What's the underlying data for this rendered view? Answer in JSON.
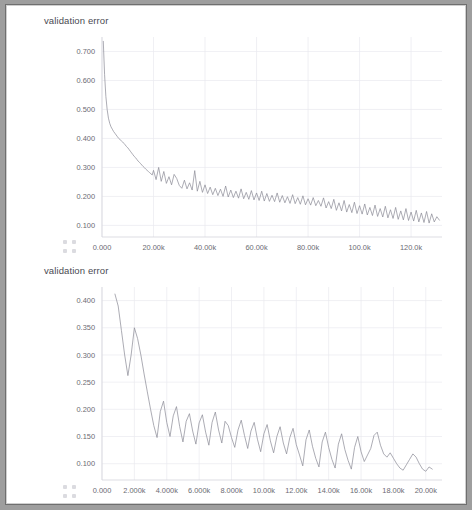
{
  "page": {
    "background_color": "#ffffff",
    "border_color": "#6f6f6f",
    "outer_color": "#9e9e9e"
  },
  "charts": [
    {
      "id": "chart-top",
      "title": "validation error",
      "grip_icon": "resize-grip-icon"
    },
    {
      "id": "chart-bottom",
      "title": "validation error",
      "grip_icon": "resize-grip-icon"
    }
  ],
  "chart_data": [
    {
      "type": "line",
      "title": "validation error",
      "xlabel": "",
      "ylabel": "",
      "grid": true,
      "legend": "none",
      "line_color": "#8c8c96",
      "xlim": [
        0,
        132000
      ],
      "ylim": [
        0.06,
        0.75
      ],
      "yticks": [
        0.1,
        0.2,
        0.3,
        0.4,
        0.5,
        0.6,
        0.7
      ],
      "ytick_labels": [
        "0.100",
        "0.200",
        "0.300",
        "0.400",
        "0.500",
        "0.600",
        "0.700"
      ],
      "xticks": [
        0,
        20000,
        40000,
        60000,
        80000,
        100000,
        120000
      ],
      "xtick_labels": [
        "0.000",
        "20.00k",
        "40.00k",
        "60.00k",
        "80.00k",
        "100.0k",
        "120.0k"
      ],
      "x": [
        500,
        1000,
        1500,
        2000,
        2500,
        3000,
        3500,
        4000,
        4500,
        5000,
        5500,
        6000,
        6500,
        7000,
        7500,
        8000,
        8500,
        9000,
        9500,
        10000,
        10500,
        11000,
        11500,
        12000,
        12500,
        13000,
        13500,
        14000,
        14500,
        15000,
        15500,
        16000,
        16500,
        17000,
        17500,
        18000,
        18500,
        19000,
        19500,
        20000,
        21000,
        22000,
        23000,
        24000,
        25000,
        26000,
        27000,
        28000,
        29000,
        30000,
        31000,
        32000,
        33000,
        34000,
        35000,
        36000,
        37000,
        38000,
        39000,
        40000,
        41000,
        42000,
        43000,
        44000,
        45000,
        46000,
        47000,
        48000,
        49000,
        50000,
        51000,
        52000,
        53000,
        54000,
        55000,
        56000,
        57000,
        58000,
        59000,
        60000,
        61000,
        62000,
        63000,
        64000,
        65000,
        66000,
        67000,
        68000,
        69000,
        70000,
        71000,
        72000,
        73000,
        74000,
        75000,
        76000,
        77000,
        78000,
        79000,
        80000,
        81000,
        82000,
        83000,
        84000,
        85000,
        86000,
        87000,
        88000,
        89000,
        90000,
        91000,
        92000,
        93000,
        94000,
        95000,
        96000,
        97000,
        98000,
        99000,
        100000,
        101000,
        102000,
        103000,
        104000,
        105000,
        106000,
        107000,
        108000,
        109000,
        110000,
        111000,
        112000,
        113000,
        114000,
        115000,
        116000,
        117000,
        118000,
        119000,
        120000,
        121000,
        122000,
        123000,
        124000,
        125000,
        126000,
        127000,
        128000,
        129000,
        130000,
        131000
      ],
      "y": [
        0.735,
        0.62,
        0.545,
        0.5,
        0.47,
        0.452,
        0.44,
        0.432,
        0.424,
        0.418,
        0.412,
        0.406,
        0.4,
        0.396,
        0.392,
        0.388,
        0.383,
        0.378,
        0.372,
        0.368,
        0.362,
        0.356,
        0.35,
        0.344,
        0.338,
        0.334,
        0.328,
        0.322,
        0.318,
        0.313,
        0.308,
        0.303,
        0.299,
        0.294,
        0.29,
        0.286,
        0.282,
        0.278,
        0.274,
        0.29,
        0.258,
        0.3,
        0.252,
        0.286,
        0.245,
        0.268,
        0.24,
        0.276,
        0.262,
        0.238,
        0.228,
        0.256,
        0.226,
        0.247,
        0.222,
        0.289,
        0.218,
        0.252,
        0.214,
        0.24,
        0.21,
        0.232,
        0.206,
        0.228,
        0.203,
        0.225,
        0.2,
        0.236,
        0.198,
        0.222,
        0.196,
        0.218,
        0.194,
        0.226,
        0.192,
        0.214,
        0.19,
        0.22,
        0.188,
        0.212,
        0.186,
        0.218,
        0.184,
        0.21,
        0.183,
        0.204,
        0.182,
        0.212,
        0.18,
        0.203,
        0.178,
        0.199,
        0.176,
        0.206,
        0.175,
        0.196,
        0.173,
        0.202,
        0.171,
        0.192,
        0.17,
        0.196,
        0.168,
        0.186,
        0.166,
        0.195,
        0.16,
        0.182,
        0.158,
        0.19,
        0.152,
        0.178,
        0.15,
        0.186,
        0.146,
        0.172,
        0.144,
        0.18,
        0.141,
        0.168,
        0.139,
        0.174,
        0.136,
        0.162,
        0.134,
        0.17,
        0.131,
        0.158,
        0.129,
        0.166,
        0.126,
        0.154,
        0.124,
        0.162,
        0.121,
        0.15,
        0.119,
        0.158,
        0.117,
        0.146,
        0.115,
        0.152,
        0.112,
        0.143,
        0.11,
        0.148,
        0.108,
        0.14,
        0.112,
        0.13,
        0.118,
        0.105,
        0.126,
        0.11
      ]
    },
    {
      "type": "line",
      "title": "validation error",
      "xlabel": "",
      "ylabel": "",
      "grid": true,
      "legend": "none",
      "line_color": "#8c8c96",
      "xlim": [
        0,
        21000
      ],
      "ylim": [
        0.07,
        0.425
      ],
      "yticks": [
        0.1,
        0.15,
        0.2,
        0.25,
        0.3,
        0.35,
        0.4
      ],
      "ytick_labels": [
        "0.100",
        "0.150",
        "0.200",
        "0.250",
        "0.300",
        "0.350",
        "0.400"
      ],
      "xticks": [
        0,
        2000,
        4000,
        6000,
        8000,
        10000,
        12000,
        14000,
        16000,
        18000,
        20000
      ],
      "xtick_labels": [
        "0.000",
        "2.000k",
        "4.000k",
        "6.000k",
        "8.000k",
        "10.00k",
        "12.00k",
        "14.00k",
        "16.00k",
        "18.00k",
        "20.00k"
      ],
      "x": [
        800,
        1000,
        1200,
        1400,
        1600,
        1800,
        2000,
        2200,
        2400,
        2600,
        2800,
        3000,
        3200,
        3400,
        3600,
        3800,
        4000,
        4200,
        4400,
        4600,
        4800,
        5000,
        5200,
        5400,
        5600,
        5800,
        6000,
        6200,
        6400,
        6600,
        6800,
        7000,
        7200,
        7400,
        7600,
        7800,
        8000,
        8200,
        8400,
        8600,
        8800,
        9000,
        9200,
        9400,
        9600,
        9800,
        10000,
        10200,
        10400,
        10600,
        10800,
        11000,
        11200,
        11400,
        11600,
        11800,
        12000,
        12200,
        12400,
        12600,
        12800,
        13000,
        13200,
        13400,
        13600,
        13800,
        14000,
        14200,
        14400,
        14600,
        14800,
        15000,
        15200,
        15400,
        15600,
        15800,
        16000,
        16200,
        16400,
        16600,
        16800,
        17000,
        17200,
        17400,
        17600,
        17800,
        18000,
        18200,
        18400,
        18600,
        18800,
        19000,
        19200,
        19400,
        19600,
        19800,
        20000,
        20200,
        20400
      ],
      "y": [
        0.412,
        0.39,
        0.345,
        0.3,
        0.262,
        0.3,
        0.35,
        0.33,
        0.3,
        0.265,
        0.232,
        0.2,
        0.17,
        0.148,
        0.196,
        0.215,
        0.176,
        0.15,
        0.188,
        0.205,
        0.168,
        0.14,
        0.178,
        0.192,
        0.16,
        0.136,
        0.175,
        0.19,
        0.158,
        0.134,
        0.176,
        0.195,
        0.162,
        0.138,
        0.178,
        0.17,
        0.148,
        0.13,
        0.162,
        0.18,
        0.152,
        0.128,
        0.16,
        0.176,
        0.145,
        0.122,
        0.155,
        0.172,
        0.142,
        0.12,
        0.15,
        0.168,
        0.138,
        0.118,
        0.148,
        0.165,
        0.135,
        0.116,
        0.096,
        0.144,
        0.162,
        0.132,
        0.11,
        0.094,
        0.14,
        0.158,
        0.13,
        0.108,
        0.092,
        0.136,
        0.155,
        0.126,
        0.106,
        0.09,
        0.13,
        0.15,
        0.122,
        0.104,
        0.116,
        0.128,
        0.152,
        0.158,
        0.134,
        0.118,
        0.112,
        0.12,
        0.11,
        0.1,
        0.092,
        0.088,
        0.098,
        0.108,
        0.118,
        0.112,
        0.1,
        0.09,
        0.086,
        0.094,
        0.09
      ]
    }
  ]
}
